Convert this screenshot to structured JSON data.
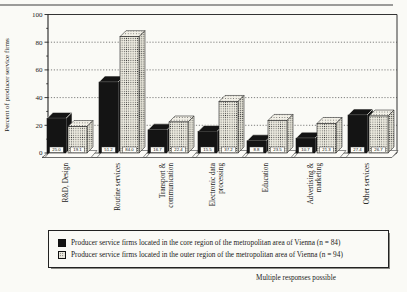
{
  "chart_data": {
    "type": "bar",
    "title": "",
    "ylabel": "Percent of producer service firms",
    "xlabel": "",
    "ylim": [
      0,
      100
    ],
    "yticks": [
      0,
      20,
      40,
      60,
      80,
      100
    ],
    "ytick_minor_step": 10,
    "grid": "horizontal-dotted",
    "style": "3d-extruded-bars, scanned print figure",
    "legend_position": "bottom-box",
    "footnote": "Multiple responses possible",
    "categories": [
      "R&D, Design",
      "Routine services",
      "Transport & communication",
      "Electronic data processing",
      "Education",
      "Advertising & marketing",
      "Other services"
    ],
    "category_lines": [
      [
        "R&D, Design"
      ],
      [
        "Routine services"
      ],
      [
        "Transport &",
        "communication"
      ],
      [
        "Electronic data",
        "processing"
      ],
      [
        "Education"
      ],
      [
        "Advertising &",
        "marketing"
      ],
      [
        "Other services"
      ]
    ],
    "series": [
      {
        "name": "core-region",
        "label": "Producer service firms located in the core region of the metropolitan area of Vienna (n = 84)",
        "n": 84,
        "color": "#141414",
        "pattern": "solid-black",
        "values": [
          25.0,
          51.2,
          16.7,
          15.5,
          8.8,
          10.7,
          27.4
        ]
      },
      {
        "name": "outer-region",
        "label": "Producer service firms located in the outer region of the metropolitan area of Vienna (n = 94)",
        "n": 94,
        "color": "#eceadf",
        "pattern": "halftone-dots",
        "values": [
          19.1,
          84.0,
          22.4,
          37.2,
          23.5,
          21.3,
          26.7
        ]
      }
    ],
    "value_labels_shown": true
  }
}
